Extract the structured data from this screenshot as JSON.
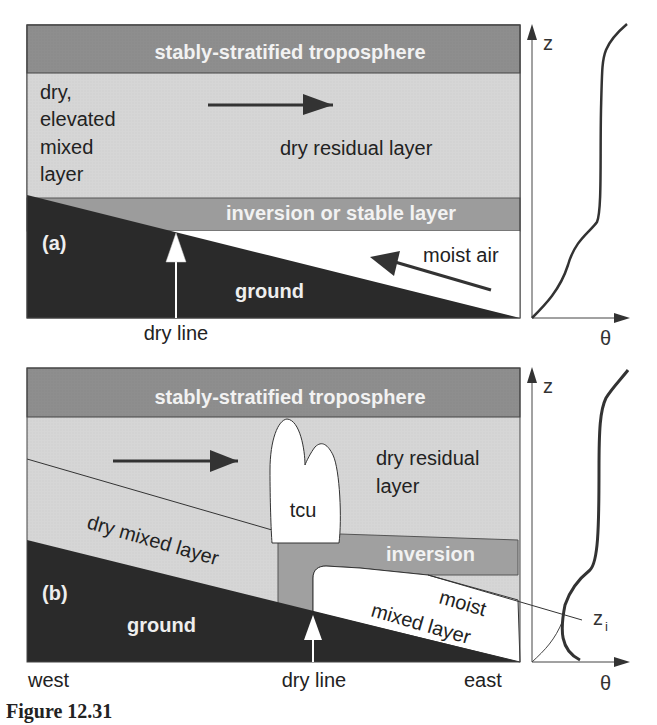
{
  "panel_a": {
    "tag": "(a)",
    "top_band": "stably-stratified troposphere",
    "left_label": [
      "dry,",
      "elevated",
      "mixed",
      "layer"
    ],
    "residual": "dry residual layer",
    "inversion": "inversion or stable layer",
    "moist": "moist air",
    "ground": "ground",
    "dry_line": "dry line",
    "axis_z": "z",
    "axis_theta": "θ"
  },
  "panel_b": {
    "tag": "(b)",
    "top_band": "stably-stratified troposphere",
    "residual": [
      "dry residual",
      "layer"
    ],
    "cloud": "tcu",
    "dry_mixed": "dry mixed layer",
    "inversion": "inversion",
    "moist": [
      "moist",
      "mixed layer"
    ],
    "ground": "ground",
    "dry_line": "dry line",
    "west": "west",
    "east": "east",
    "axis_z": "z",
    "axis_theta": "θ",
    "zi": "z",
    "zi_sub": "i"
  },
  "caption": "Figure 12.31",
  "colors": {
    "dark_band": "#8c8c8c",
    "light_band": "#d4d4d4",
    "inversion_band": "#9a9a9a",
    "ground": "#2a2a2a",
    "arrow": "#333333"
  }
}
